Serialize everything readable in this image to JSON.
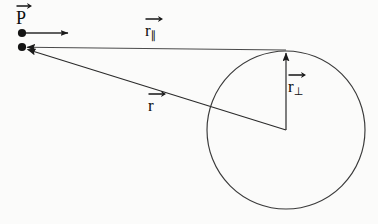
{
  "figure": {
    "type": "vector-decomposition-diagram",
    "background_color": "#fbfbfa",
    "stroke_color": "#1a1a1a"
  },
  "labels": {
    "point_p": {
      "text": "P",
      "vector_arrow": true
    },
    "r_parallel": {
      "text": "r",
      "subscript": "∥",
      "vector_arrow": true
    },
    "r_perpendicular": {
      "text": "r",
      "subscript": "⊥",
      "vector_arrow": true
    },
    "r": {
      "text": "r",
      "subscript": "",
      "vector_arrow": true
    }
  },
  "geometry": {
    "point_p_upper_dot": {
      "x": 22,
      "y": 33,
      "radius": 4
    },
    "point_p_lower_dot": {
      "x": 22,
      "y": 47,
      "radius": 4
    },
    "p_direction_arrow": {
      "x1": 22,
      "y1": 33,
      "x2": 70,
      "y2": 33
    },
    "r_parallel_arrow": {
      "x1": 286,
      "y1": 50,
      "x2": 24,
      "y2": 47
    },
    "r_arrow": {
      "x1": 286,
      "y1": 130,
      "x2": 24,
      "y2": 49
    },
    "r_perpendicular_arrow": {
      "x1": 286,
      "y1": 130,
      "x2": 286,
      "y2": 51
    },
    "circle": {
      "cx": 286,
      "cy": 130,
      "r": 79
    }
  }
}
